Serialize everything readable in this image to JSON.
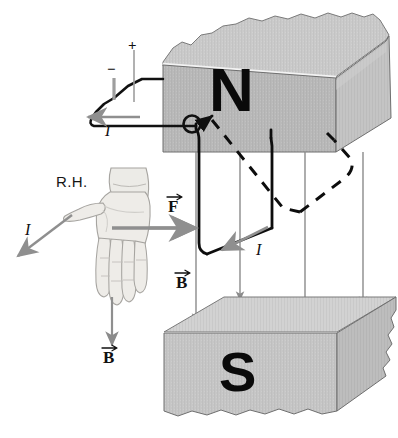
{
  "figure": {
    "background": "#ffffff"
  },
  "magnets": {
    "north": {
      "pole_label": "N",
      "face_color": "#b9b9b9",
      "top_color": "#cacaca",
      "side_color": "#c4c4c4",
      "edge_color": "#6f6f6f"
    },
    "south": {
      "pole_label": "S",
      "face_color": "#c6c6c6",
      "top_color": "#d2d2d2",
      "side_color": "#bdbdbd",
      "edge_color": "#6f6f6f"
    }
  },
  "battery": {
    "negative_label": "−",
    "positive_label": "+",
    "wire_color": "#111111"
  },
  "hand": {
    "label": "R.H.",
    "skin_color": "#eceae6",
    "outline_color": "#9a9894"
  },
  "labels": {
    "force": "F",
    "field": "B",
    "current": "I"
  },
  "annotations": [
    {
      "name": "current-battery-lead",
      "text": "I",
      "x": 105,
      "y": 128
    },
    {
      "name": "current-thumb",
      "text": "I",
      "x": 25,
      "y": 229
    },
    {
      "name": "current-loop-bottom",
      "text": "I",
      "x": 256,
      "y": 249
    },
    {
      "name": "force-loop",
      "text": "F",
      "x": 170,
      "y": 207
    },
    {
      "name": "field-loop",
      "text": "B",
      "x": 177,
      "y": 283
    },
    {
      "name": "field-hand",
      "text": "B",
      "x": 103,
      "y": 357
    }
  ],
  "field_arrows": {
    "color": "#8b8b8b",
    "count": 4,
    "direction": "down",
    "description": "Vertical magnetic field lines from N pole down to S pole"
  },
  "force_arrow": {
    "color": "#8f8f8f",
    "direction": "right"
  },
  "current_arrows": {
    "color": "#8f8f8f"
  },
  "wire_loop": {
    "color": "#0d0d0d",
    "front_style": "solid",
    "back_style": "dashed",
    "pivot_marker": "open-circle"
  }
}
